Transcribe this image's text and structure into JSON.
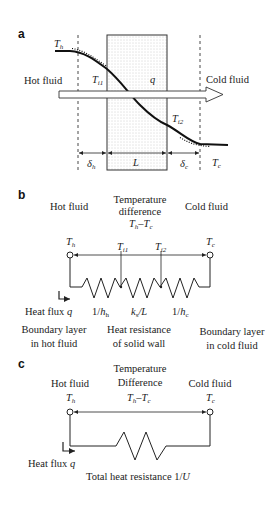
{
  "panel_a": {
    "label": "a",
    "hot_fluid": "Hot fluid",
    "cold_fluid": "Cold fluid",
    "Th": {
      "main": "T",
      "sub": "h"
    },
    "Ti1": {
      "main": "T",
      "sub": "i1"
    },
    "Ti2": {
      "main": "T",
      "sub": "i2"
    },
    "Tc": {
      "main": "T",
      "sub": "c"
    },
    "q": "q",
    "delta_h": {
      "main": "δ",
      "sub": "h"
    },
    "L": "L",
    "delta_c": {
      "main": "δ",
      "sub": "c"
    }
  },
  "panel_b": {
    "label": "b",
    "hot_fluid": "Hot fluid",
    "temp_diff_line1": "Temperature",
    "temp_diff_line2": "difference",
    "cold_fluid": "Cold fluid",
    "Th": {
      "main": "T",
      "sub": "h"
    },
    "Ti1": {
      "main": "T",
      "sub": "i1"
    },
    "Ti2": {
      "main": "T",
      "sub": "i2"
    },
    "Tc": {
      "main": "T",
      "sub": "c"
    },
    "heat_flux": "Heat flux",
    "q": "q",
    "r1": {
      "pre": "1/",
      "main": "h",
      "sub": "h"
    },
    "r2": {
      "main": "k",
      "sub": "s",
      "post": "/L"
    },
    "r3": {
      "pre": "1/",
      "main": "h",
      "sub": "c"
    },
    "bl_hot_1": "Boundary layer",
    "bl_hot_2": "in hot fluid",
    "wall_1": "Heat resistance",
    "wall_2": "of solid wall",
    "bl_cold_1": "Boundary layer",
    "bl_cold_2": "in cold fluid"
  },
  "panel_c": {
    "label": "c",
    "hot_fluid": "Hot fluid",
    "temp_diff_line1": "Temperature",
    "temp_diff_line2": "Difference",
    "cold_fluid": "Cold fluid",
    "Th": {
      "main": "T",
      "sub": "h"
    },
    "Tc": {
      "main": "T",
      "sub": "c"
    },
    "heat_flux": "Heat flux",
    "q": "q",
    "total_resistance": "Total heat resistance 1/",
    "U": "U"
  }
}
